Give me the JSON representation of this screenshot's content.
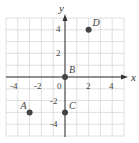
{
  "chart_data": {
    "type": "scatter",
    "title": "",
    "xlabel": "x",
    "ylabel": "y",
    "xlim": [
      -5,
      5
    ],
    "ylim": [
      -5,
      5
    ],
    "grid": true,
    "x_ticks": [
      "-4",
      "-2",
      "0",
      "2",
      "4"
    ],
    "y_ticks": [
      "4",
      "2",
      "-2",
      "-4"
    ],
    "points": [
      {
        "label": "A",
        "x": -3,
        "y": -3
      },
      {
        "label": "B",
        "x": 0,
        "y": 0
      },
      {
        "label": "C",
        "x": 0,
        "y": -3
      },
      {
        "label": "D",
        "x": 2,
        "y": 4
      }
    ],
    "colors": {
      "grid": "#d8d8d8",
      "axis": "#333333",
      "point": "#444444"
    }
  }
}
